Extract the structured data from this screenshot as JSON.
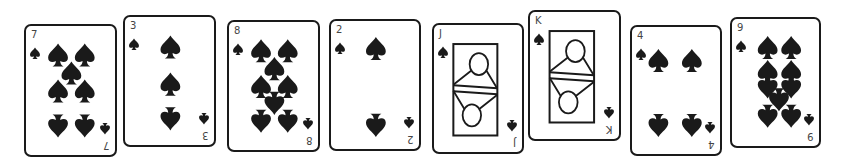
{
  "cards": [
    {
      "rank": "7",
      "suit": "spades",
      "suit_icon": "spade-icon",
      "face": false
    },
    {
      "rank": "3",
      "suit": "spades",
      "suit_icon": "spade-icon",
      "face": false
    },
    {
      "rank": "8",
      "suit": "spades",
      "suit_icon": "spade-icon",
      "face": false
    },
    {
      "rank": "2",
      "suit": "spades",
      "suit_icon": "spade-icon",
      "face": false
    },
    {
      "rank": "J",
      "suit": "spades",
      "suit_icon": "spade-icon",
      "face": true
    },
    {
      "rank": "K",
      "suit": "spades",
      "suit_icon": "spade-icon",
      "face": true
    },
    {
      "rank": "4",
      "suit": "spades",
      "suit_icon": "spade-icon",
      "face": false
    },
    {
      "rank": "9",
      "suit": "spades",
      "suit_icon": "spade-icon",
      "face": false
    }
  ],
  "colors": {
    "ink": "#1a1a1a",
    "rank_text": "#444444",
    "card_bg": "#ffffff"
  }
}
